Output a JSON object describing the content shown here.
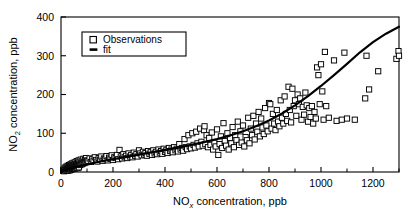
{
  "chart_data": {
    "type": "scatter",
    "title": "",
    "xlabel": "NOx concentration, ppb",
    "ylabel": "NO2 concentration, ppb",
    "xlabel_parts": {
      "base": "NO",
      "sub": "x",
      "rest": " concentration, ppb"
    },
    "ylabel_parts": {
      "base": "NO",
      "sub": "2",
      "rest": " concentration, ppb"
    },
    "xlim": [
      0,
      1300
    ],
    "ylim": [
      0,
      400
    ],
    "x_major_ticks": [
      0,
      200,
      400,
      600,
      800,
      1000,
      1200
    ],
    "x_minor_ticks": [
      100,
      300,
      500,
      700,
      900,
      1100,
      1300
    ],
    "y_major_ticks": [
      0,
      100,
      200,
      300,
      400
    ],
    "x_tick_labels": [
      "0",
      "200",
      "400",
      "600",
      "800",
      "1000",
      "1200"
    ],
    "y_tick_labels": [
      "0",
      "100",
      "200",
      "300",
      "400"
    ],
    "grid": false,
    "legend_position": "upper left",
    "legend": [
      {
        "label": "Observations",
        "marker": "open-square",
        "color": "#000000"
      },
      {
        "label": "fit",
        "marker": "thick-line",
        "color": "#000000"
      }
    ],
    "marker_color": "#000000",
    "line_color": "#000000",
    "fit": {
      "description": "monotonic superlinear fit curve through observations",
      "points": [
        [
          0,
          2
        ],
        [
          50,
          12
        ],
        [
          100,
          20
        ],
        [
          150,
          27
        ],
        [
          200,
          33
        ],
        [
          250,
          39
        ],
        [
          300,
          45
        ],
        [
          350,
          51
        ],
        [
          400,
          57
        ],
        [
          450,
          63
        ],
        [
          500,
          70
        ],
        [
          550,
          77
        ],
        [
          600,
          85
        ],
        [
          650,
          94
        ],
        [
          700,
          105
        ],
        [
          750,
          118
        ],
        [
          800,
          133
        ],
        [
          850,
          151
        ],
        [
          900,
          172
        ],
        [
          950,
          196
        ],
        [
          1000,
          222
        ],
        [
          1050,
          250
        ],
        [
          1100,
          279
        ],
        [
          1150,
          309
        ],
        [
          1200,
          335
        ],
        [
          1250,
          357
        ],
        [
          1300,
          375
        ]
      ]
    },
    "series": [
      {
        "name": "Observations",
        "marker": "open-square",
        "points": [
          [
            8,
            3
          ],
          [
            10,
            6
          ],
          [
            12,
            2
          ],
          [
            14,
            9
          ],
          [
            15,
            5
          ],
          [
            17,
            12
          ],
          [
            18,
            4
          ],
          [
            20,
            8
          ],
          [
            21,
            14
          ],
          [
            22,
            6
          ],
          [
            24,
            11
          ],
          [
            25,
            3
          ],
          [
            26,
            16
          ],
          [
            27,
            9
          ],
          [
            28,
            5
          ],
          [
            29,
            13
          ],
          [
            30,
            7
          ],
          [
            31,
            18
          ],
          [
            32,
            10
          ],
          [
            33,
            4
          ],
          [
            34,
            15
          ],
          [
            35,
            8
          ],
          [
            36,
            12
          ],
          [
            37,
            20
          ],
          [
            38,
            6
          ],
          [
            39,
            17
          ],
          [
            40,
            9
          ],
          [
            41,
            13
          ],
          [
            42,
            22
          ],
          [
            43,
            7
          ],
          [
            44,
            16
          ],
          [
            45,
            11
          ],
          [
            46,
            19
          ],
          [
            47,
            8
          ],
          [
            48,
            14
          ],
          [
            49,
            24
          ],
          [
            50,
            10
          ],
          [
            51,
            18
          ],
          [
            52,
            12
          ],
          [
            53,
            21
          ],
          [
            54,
            9
          ],
          [
            55,
            16
          ],
          [
            56,
            26
          ],
          [
            57,
            13
          ],
          [
            58,
            20
          ],
          [
            59,
            11
          ],
          [
            60,
            17
          ],
          [
            61,
            28
          ],
          [
            62,
            14
          ],
          [
            63,
            22
          ],
          [
            64,
            10
          ],
          [
            65,
            19
          ],
          [
            66,
            25
          ],
          [
            67,
            15
          ],
          [
            68,
            30
          ],
          [
            69,
            12
          ],
          [
            70,
            21
          ],
          [
            72,
            27
          ],
          [
            74,
            18
          ],
          [
            76,
            32
          ],
          [
            78,
            24
          ],
          [
            80,
            20
          ],
          [
            82,
            29
          ],
          [
            84,
            22
          ],
          [
            86,
            34
          ],
          [
            88,
            26
          ],
          [
            90,
            23
          ],
          [
            92,
            31
          ],
          [
            94,
            27
          ],
          [
            96,
            36
          ],
          [
            98,
            25
          ],
          [
            100,
            30
          ],
          [
            105,
            28
          ],
          [
            110,
            35
          ],
          [
            115,
            26
          ],
          [
            120,
            33
          ],
          [
            125,
            29
          ],
          [
            130,
            38
          ],
          [
            135,
            31
          ],
          [
            140,
            27
          ],
          [
            145,
            36
          ],
          [
            150,
            32
          ],
          [
            155,
            40
          ],
          [
            160,
            29
          ],
          [
            165,
            35
          ],
          [
            170,
            33
          ],
          [
            175,
            41
          ],
          [
            180,
            30
          ],
          [
            185,
            37
          ],
          [
            190,
            34
          ],
          [
            195,
            43
          ],
          [
            200,
            31
          ],
          [
            205,
            38
          ],
          [
            210,
            36
          ],
          [
            215,
            44
          ],
          [
            220,
            33
          ],
          [
            225,
            57
          ],
          [
            230,
            40
          ],
          [
            235,
            35
          ],
          [
            240,
            46
          ],
          [
            245,
            38
          ],
          [
            250,
            42
          ],
          [
            255,
            36
          ],
          [
            260,
            48
          ],
          [
            265,
            40
          ],
          [
            270,
            44
          ],
          [
            275,
            38
          ],
          [
            280,
            50
          ],
          [
            285,
            42
          ],
          [
            290,
            46
          ],
          [
            295,
            40
          ],
          [
            300,
            56
          ],
          [
            305,
            48
          ],
          [
            310,
            43
          ],
          [
            315,
            52
          ],
          [
            320,
            45
          ],
          [
            325,
            49
          ],
          [
            330,
            42
          ],
          [
            335,
            54
          ],
          [
            340,
            47
          ],
          [
            345,
            51
          ],
          [
            350,
            44
          ],
          [
            355,
            56
          ],
          [
            360,
            48
          ],
          [
            365,
            52
          ],
          [
            370,
            46
          ],
          [
            375,
            58
          ],
          [
            380,
            50
          ],
          [
            385,
            54
          ],
          [
            390,
            47
          ],
          [
            395,
            60
          ],
          [
            400,
            52
          ],
          [
            405,
            56
          ],
          [
            410,
            49
          ],
          [
            415,
            62
          ],
          [
            420,
            54
          ],
          [
            425,
            58
          ],
          [
            430,
            51
          ],
          [
            435,
            64
          ],
          [
            440,
            56
          ],
          [
            445,
            60
          ],
          [
            450,
            53
          ],
          [
            455,
            72
          ],
          [
            460,
            58
          ],
          [
            465,
            62
          ],
          [
            470,
            55
          ],
          [
            475,
            85
          ],
          [
            480,
            64
          ],
          [
            485,
            59
          ],
          [
            490,
            95
          ],
          [
            495,
            66
          ],
          [
            500,
            61
          ],
          [
            505,
            100
          ],
          [
            510,
            70
          ],
          [
            515,
            63
          ],
          [
            520,
            104
          ],
          [
            525,
            74
          ],
          [
            530,
            66
          ],
          [
            535,
            112
          ],
          [
            540,
            78
          ],
          [
            545,
            68
          ],
          [
            550,
            108
          ],
          [
            552,
            118
          ],
          [
            555,
            72
          ],
          [
            560,
            95
          ],
          [
            565,
            64
          ],
          [
            570,
            88
          ],
          [
            575,
            70
          ],
          [
            580,
            102
          ],
          [
            585,
            58
          ],
          [
            590,
            76
          ],
          [
            595,
            66
          ],
          [
            600,
            110
          ],
          [
            605,
            44
          ],
          [
            610,
            72
          ],
          [
            615,
            92
          ],
          [
            620,
            62
          ],
          [
            625,
            126
          ],
          [
            630,
            80
          ],
          [
            635,
            68
          ],
          [
            640,
            100
          ],
          [
            645,
            58
          ],
          [
            650,
            88
          ],
          [
            655,
            74
          ],
          [
            660,
            116
          ],
          [
            665,
            64
          ],
          [
            670,
            95
          ],
          [
            675,
            82
          ],
          [
            680,
            130
          ],
          [
            685,
            70
          ],
          [
            690,
            105
          ],
          [
            695,
            76
          ],
          [
            700,
            120
          ],
          [
            705,
            66
          ],
          [
            710,
            90
          ],
          [
            715,
            82
          ],
          [
            720,
            140
          ],
          [
            725,
            74
          ],
          [
            730,
            112
          ],
          [
            735,
            95
          ],
          [
            740,
            145
          ],
          [
            745,
            84
          ],
          [
            750,
            125
          ],
          [
            755,
            104
          ],
          [
            760,
            155
          ],
          [
            765,
            92
          ],
          [
            770,
            138
          ],
          [
            775,
            115
          ],
          [
            780,
            98
          ],
          [
            785,
            165
          ],
          [
            790,
            120
          ],
          [
            795,
            105
          ],
          [
            800,
            178
          ],
          [
            805,
            175
          ],
          [
            810,
            112
          ],
          [
            815,
            150
          ],
          [
            820,
            125
          ],
          [
            825,
            108
          ],
          [
            830,
            160
          ],
          [
            835,
            130
          ],
          [
            840,
            118
          ],
          [
            845,
            185
          ],
          [
            850,
            140
          ],
          [
            855,
            125
          ],
          [
            860,
            195
          ],
          [
            865,
            150
          ],
          [
            870,
            132
          ],
          [
            875,
            220
          ],
          [
            880,
            160
          ],
          [
            885,
            128
          ],
          [
            890,
            215
          ],
          [
            895,
            170
          ],
          [
            900,
            185
          ],
          [
            905,
            145
          ],
          [
            910,
            200
          ],
          [
            915,
            175
          ],
          [
            920,
            190
          ],
          [
            925,
            135
          ],
          [
            930,
            168
          ],
          [
            935,
            148
          ],
          [
            940,
            205
          ],
          [
            945,
            172
          ],
          [
            950,
            130
          ],
          [
            955,
            165
          ],
          [
            960,
            142
          ],
          [
            965,
            170
          ],
          [
            970,
            125
          ],
          [
            975,
            155
          ],
          [
            980,
            138
          ],
          [
            985,
            270
          ],
          [
            990,
            250
          ],
          [
            995,
            175
          ],
          [
            1000,
            278
          ],
          [
            1005,
            208
          ],
          [
            1010,
            135
          ],
          [
            1015,
            310
          ],
          [
            1020,
            170
          ],
          [
            1030,
            140
          ],
          [
            1050,
            288
          ],
          [
            1060,
            132
          ],
          [
            1080,
            135
          ],
          [
            1090,
            308
          ],
          [
            1100,
            138
          ],
          [
            1130,
            135
          ],
          [
            1170,
            190
          ],
          [
            1175,
            300
          ],
          [
            1185,
            213
          ],
          [
            1220,
            260
          ],
          [
            1290,
            292
          ],
          [
            1298,
            312
          ],
          [
            1300,
            300
          ]
        ]
      }
    ]
  },
  "legend_box": {
    "observations_label": "Observations",
    "fit_label": "fit"
  }
}
